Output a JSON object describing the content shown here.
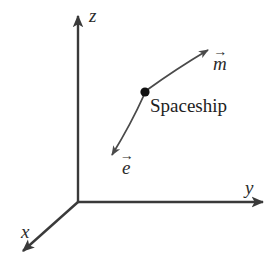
{
  "figure": {
    "background_color": "#ffffff",
    "stroke_color": "#3a3a3a",
    "text_color": "#2b2b2b",
    "width": 278,
    "height": 264
  },
  "axes": {
    "origin": {
      "x": 78,
      "y": 202
    },
    "z": {
      "label": "z",
      "icon": "arrow-up-icon",
      "from": {
        "x": 78,
        "y": 202
      },
      "to": {
        "x": 78,
        "y": 13
      }
    },
    "y": {
      "label": "y",
      "icon": "arrow-right-icon",
      "from": {
        "x": 78,
        "y": 202
      },
      "to": {
        "x": 266,
        "y": 202
      }
    },
    "x": {
      "label": "x",
      "icon": "arrow-down-left-icon",
      "from": {
        "x": 78,
        "y": 202
      },
      "to": {
        "x": 20,
        "y": 254
      }
    }
  },
  "spaceship": {
    "label": "Spaceship",
    "marker": {
      "x": 145,
      "y": 92,
      "radius": 4.6
    }
  },
  "vectors": [
    {
      "name": "m",
      "label": "m",
      "overarrow": "→",
      "icon": "vector-arrow-m-icon",
      "from": {
        "x": 145,
        "y": 92
      },
      "to": {
        "x": 211,
        "y": 47
      },
      "control": {
        "x": 172,
        "y": 64
      },
      "direction": "up-right"
    },
    {
      "name": "e",
      "label": "e",
      "overarrow": "→",
      "icon": "vector-arrow-e-icon",
      "from": {
        "x": 145,
        "y": 92
      },
      "to": {
        "x": 109,
        "y": 159
      },
      "control": {
        "x": 130,
        "y": 123
      },
      "direction": "down-left"
    }
  ]
}
